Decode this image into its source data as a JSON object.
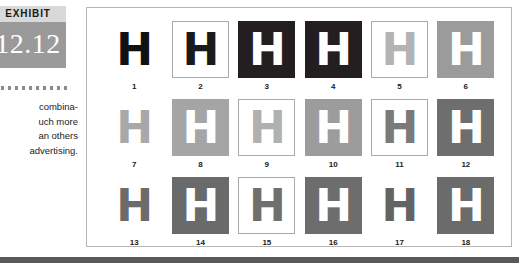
{
  "exhibit": {
    "label": "EXHIBIT",
    "number": "12.12",
    "label_bg": "#d9d9d9",
    "number_bg": "#9a9a9a",
    "number_color": "#ffffff"
  },
  "divider": {
    "dot_count": 11,
    "dot_color": "#8c8c8c"
  },
  "caption": {
    "lines": [
      "combina-",
      "uch more",
      "an others",
      "advertising."
    ]
  },
  "figure": {
    "glyph": "H",
    "panel_bg": "#ffffff",
    "panel_border": "#b6b6b6",
    "columns": 6,
    "rows": 3,
    "cells": [
      {
        "number": "1",
        "bg": "#ffffff",
        "fg": "#111111",
        "bordered": false
      },
      {
        "number": "2",
        "bg": "#ffffff",
        "fg": "#1a1a1a",
        "bordered": true
      },
      {
        "number": "3",
        "bg": "#231f20",
        "fg": "#ffffff",
        "bordered": false
      },
      {
        "number": "4",
        "bg": "#231f20",
        "fg": "#ffffff",
        "bordered": false
      },
      {
        "number": "5",
        "bg": "#ffffff",
        "fg": "#b3b3b3",
        "bordered": true
      },
      {
        "number": "6",
        "bg": "#9b9b9b",
        "fg": "#ffffff",
        "bordered": false
      },
      {
        "number": "7",
        "bg": "#ffffff",
        "fg": "#a8a8a8",
        "bordered": false
      },
      {
        "number": "8",
        "bg": "#a5a5a5",
        "fg": "#ffffff",
        "bordered": false
      },
      {
        "number": "9",
        "bg": "#ffffff",
        "fg": "#b0b0b0",
        "bordered": true
      },
      {
        "number": "10",
        "bg": "#9c9c9c",
        "fg": "#ffffff",
        "bordered": false
      },
      {
        "number": "11",
        "bg": "#ffffff",
        "fg": "#7a7a7a",
        "bordered": true
      },
      {
        "number": "12",
        "bg": "#6e6e6e",
        "fg": "#ffffff",
        "bordered": false
      },
      {
        "number": "13",
        "bg": "#ffffff",
        "fg": "#6b6b6b",
        "bordered": false
      },
      {
        "number": "14",
        "bg": "#6a6a6a",
        "fg": "#ffffff",
        "bordered": false
      },
      {
        "number": "15",
        "bg": "#ffffff",
        "fg": "#6f6f6f",
        "bordered": true
      },
      {
        "number": "16",
        "bg": "#6d6d6d",
        "fg": "#ffffff",
        "bordered": false
      },
      {
        "number": "17",
        "bg": "#ffffff",
        "fg": "#636363",
        "bordered": false
      },
      {
        "number": "18",
        "bg": "#6b6b6b",
        "fg": "#ffffff",
        "bordered": false
      }
    ]
  },
  "footer": {
    "bar_color": "#58595b"
  }
}
